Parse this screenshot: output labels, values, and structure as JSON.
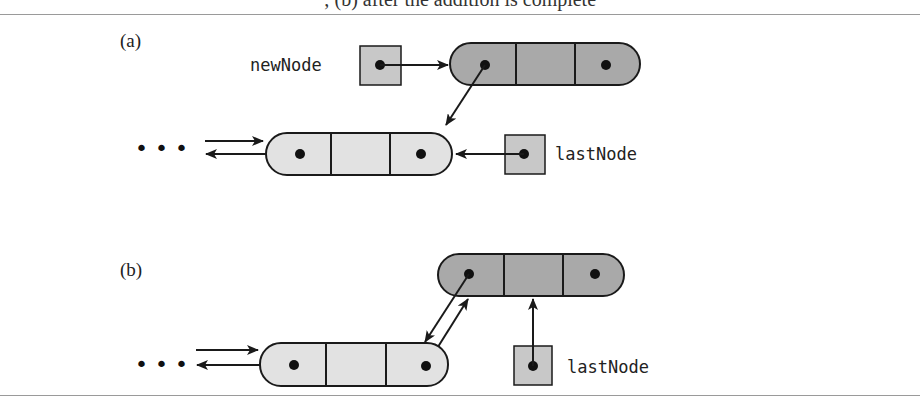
{
  "caption": {
    "text": "FIGURE 14-8 (a) Adding a new node to the end of a nonempty chain; (b) after the addition is complete",
    "visible_fragment": "; (b) after the addition is complete"
  },
  "panels": [
    {
      "label": "(a)",
      "new_node_ref": {
        "name": "newNode"
      },
      "last_node_ref": {
        "name": "lastNode"
      },
      "nodes": [
        {
          "id": "existing-last",
          "fill": "#e2e2e2",
          "cells": 3
        },
        {
          "id": "new",
          "fill": "#a9a9a9",
          "cells": 3
        }
      ],
      "ellipsis": "• • •"
    },
    {
      "label": "(b)",
      "last_node_ref": {
        "name": "lastNode"
      },
      "nodes": [
        {
          "id": "previous",
          "fill": "#e2e2e2",
          "cells": 3
        },
        {
          "id": "new-last",
          "fill": "#a9a9a9",
          "cells": 3
        }
      ],
      "ellipsis": "• • •"
    }
  ],
  "colors": {
    "stroke": "#1a1a1a",
    "light_node": "#e2e2e2",
    "dark_node": "#a9a9a9",
    "ref_box": "#c8c8c8"
  }
}
